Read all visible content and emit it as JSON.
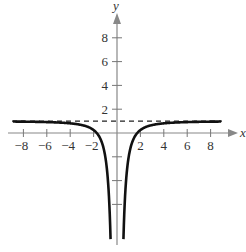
{
  "chart_data": {
    "type": "line",
    "title": "",
    "xlabel": "x",
    "ylabel": "y",
    "xlim": [
      -9,
      9
    ],
    "ylim": [
      -9.5,
      10
    ],
    "grid": false,
    "x_ticks": [
      -8,
      -6,
      -4,
      -2,
      2,
      4,
      6,
      8
    ],
    "y_ticks": [
      2,
      4,
      6,
      8
    ],
    "y_ticks_unlabeled": [
      -2,
      -4,
      -6
    ],
    "series": [
      {
        "name": "f(x)",
        "function": "y = 1 - 3/x^2",
        "x": [
          -9,
          -8,
          -6,
          -4,
          -3,
          -2,
          -1.5,
          -1,
          -0.6,
          0.6,
          1,
          1.5,
          2,
          3,
          4,
          6,
          8,
          9
        ],
        "values": [
          0.96,
          0.95,
          0.92,
          0.81,
          0.67,
          0.25,
          -0.33,
          -2,
          -7.3,
          -7.3,
          -2,
          -0.33,
          0.25,
          0.67,
          0.81,
          0.92,
          0.95,
          0.96
        ]
      }
    ],
    "annotations": [
      {
        "type": "horizontal_asymptote",
        "y": 1,
        "style": "dashed"
      },
      {
        "type": "vertical_asymptote",
        "x": 0
      }
    ]
  },
  "axes": {
    "x_label": "x",
    "y_label": "y"
  }
}
